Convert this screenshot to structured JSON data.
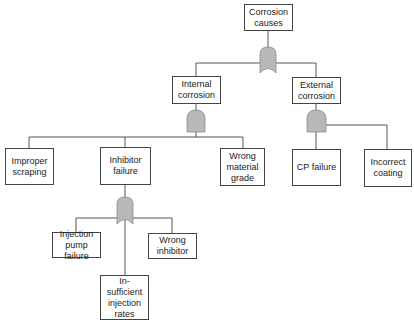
{
  "diagram": {
    "type": "fault-tree",
    "colors": {
      "line": "#555555",
      "gate_fill": "#b8b8b8",
      "gate_stroke": "#8a8a8a",
      "box_border": "#444444"
    },
    "nodes": {
      "root": {
        "label": "Corrosion causes",
        "lines": [
          "Corrosion",
          "causes"
        ]
      },
      "internal": {
        "label": "Internal corrosion",
        "lines": [
          "Internal",
          "corrosion"
        ]
      },
      "external": {
        "label": "External corrosion",
        "lines": [
          "External",
          "corrosion"
        ]
      },
      "improper_scraping": {
        "label": "Improper scraping",
        "lines": [
          "Improper",
          "scraping"
        ]
      },
      "inhibitor_failure": {
        "label": "Inhibitor failure",
        "lines": [
          "Inhibitor",
          "failure"
        ]
      },
      "wrong_material": {
        "label": "Wrong material grade",
        "lines": [
          "Wrong",
          "material",
          "grade"
        ]
      },
      "cp_failure": {
        "label": "CP failure",
        "lines": [
          "CP failure"
        ]
      },
      "incorrect_coating": {
        "label": "Incorrect coating",
        "lines": [
          "Incorrect",
          "coating"
        ]
      },
      "injection_pump": {
        "label": "Injection pump failure",
        "lines": [
          "Injection",
          "pump",
          "failure"
        ]
      },
      "insufficient_rates": {
        "label": "In-sufficient injection rates",
        "lines": [
          "In-",
          "sufficient",
          "injection",
          "rates"
        ]
      },
      "wrong_inhibitor": {
        "label": "Wrong inhibitor",
        "lines": [
          "Wrong",
          "inhibitor"
        ]
      }
    },
    "gates": [
      {
        "id": "root-gate",
        "type": "OR",
        "parent": "root",
        "children": [
          "internal",
          "external"
        ]
      },
      {
        "id": "internal-gate",
        "type": "AND",
        "parent": "internal",
        "children": [
          "improper_scraping",
          "inhibitor_failure",
          "wrong_material"
        ]
      },
      {
        "id": "external-gate",
        "type": "AND",
        "parent": "external",
        "children": [
          "cp_failure",
          "incorrect_coating"
        ]
      },
      {
        "id": "inhibitor-gate",
        "type": "OR",
        "parent": "inhibitor_failure",
        "children": [
          "injection_pump",
          "insufficient_rates",
          "wrong_inhibitor"
        ]
      }
    ]
  }
}
